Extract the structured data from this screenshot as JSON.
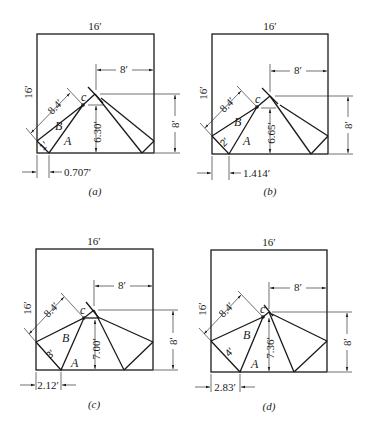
{
  "panels": [
    {
      "id": "a",
      "caption": "(a)",
      "top_width": "16′",
      "left_height": "16′",
      "right_offset": "8′",
      "right_height": "8′",
      "diag_length": "8.4′",
      "c_label": "c",
      "region_b": "B",
      "region_a": "A",
      "small_edge": "1′",
      "c_height": "6.30′",
      "bottom_offset": "0.707′"
    },
    {
      "id": "b",
      "caption": "(b)",
      "top_width": "16′",
      "left_height": "16′",
      "right_offset": "8′",
      "right_height": "8′",
      "diag_length": "8.4′",
      "c_label": "c",
      "region_b": "B",
      "region_a": "A",
      "small_edge": "2′",
      "c_height": "6.65′",
      "bottom_offset": "1.414′"
    },
    {
      "id": "c",
      "caption": "(c)",
      "top_width": "16′",
      "left_height": "16′",
      "right_offset": "8′",
      "right_height": "8′",
      "diag_length": "8.4′",
      "c_label": "c",
      "region_b": "B",
      "region_a": "A",
      "small_edge": "3′",
      "c_height": "7.00′",
      "bottom_offset": "2.12′"
    },
    {
      "id": "d",
      "caption": "(d)",
      "top_width": "16′",
      "left_height": "16′",
      "right_offset": "8′",
      "right_height": "8′",
      "diag_length": "8.4′",
      "c_label": "c",
      "region_b": "B",
      "region_a": "A",
      "small_edge": "4′",
      "c_height": "7.36′",
      "bottom_offset": "2.83′"
    }
  ]
}
